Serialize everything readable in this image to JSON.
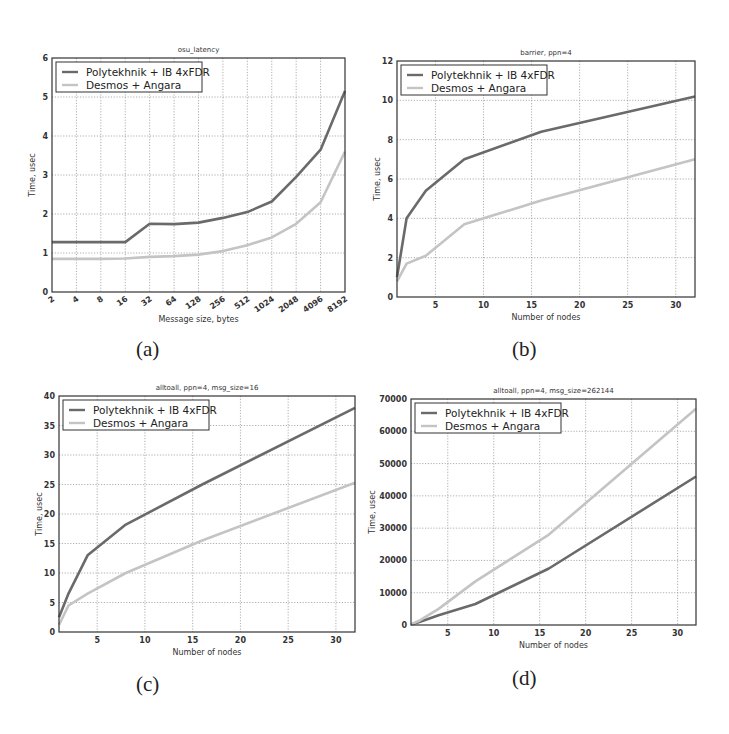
{
  "colors": {
    "polytekhnik": "#6a6a6a",
    "desmos": "#c4c4c4",
    "axis": "#333333",
    "grid": "#9a9a9a"
  },
  "sublabels": [
    "(a)",
    "(b)",
    "(c)",
    "(d)"
  ],
  "chart_data": [
    {
      "type": "line",
      "title": "osu_latency",
      "xlabel": "Message size, bytes",
      "ylabel": "Time, usec",
      "xscale": "categorical-log2",
      "categories": [
        "2",
        "4",
        "8",
        "16",
        "32",
        "64",
        "128",
        "256",
        "512",
        "1024",
        "2048",
        "4096",
        "8192"
      ],
      "ylim": [
        0,
        6
      ],
      "yticks": [
        0,
        1,
        2,
        3,
        4,
        5,
        6
      ],
      "grid": true,
      "legend_position": "upper left",
      "series": [
        {
          "name": "Polytekhnik + IB 4xFDR",
          "values": [
            1.28,
            1.28,
            1.28,
            1.28,
            1.75,
            1.74,
            1.78,
            1.9,
            2.05,
            2.32,
            2.95,
            3.65,
            5.15
          ]
        },
        {
          "name": "Desmos + Angara",
          "values": [
            0.85,
            0.85,
            0.85,
            0.86,
            0.9,
            0.92,
            0.96,
            1.05,
            1.2,
            1.4,
            1.75,
            2.3,
            3.6
          ]
        }
      ]
    },
    {
      "type": "line",
      "title": "barrier, ppn=4",
      "xlabel": "Number of nodes",
      "ylabel": "Time, usec",
      "x": [
        1,
        2,
        4,
        8,
        16,
        32
      ],
      "xlim": [
        1,
        32
      ],
      "xticks": [
        5,
        10,
        15,
        20,
        25,
        30
      ],
      "ylim": [
        0,
        12
      ],
      "yticks": [
        0,
        2,
        4,
        6,
        8,
        10,
        12
      ],
      "grid": true,
      "legend_position": "upper left",
      "series": [
        {
          "name": "Polytekhnik + IB 4xFDR",
          "values": [
            1.0,
            4.0,
            5.4,
            7.0,
            8.4,
            10.2
          ]
        },
        {
          "name": "Desmos + Angara",
          "values": [
            0.8,
            1.7,
            2.1,
            3.7,
            4.9,
            7.0
          ]
        }
      ]
    },
    {
      "type": "line",
      "title": "alltoall, ppn=4, msg_size=16",
      "xlabel": "Number of nodes",
      "ylabel": "Time, usec",
      "x": [
        1,
        2,
        4,
        8,
        16,
        32
      ],
      "xlim": [
        1,
        32
      ],
      "xticks": [
        5,
        10,
        15,
        20,
        25,
        30
      ],
      "ylim": [
        0,
        40
      ],
      "yticks": [
        0,
        5,
        10,
        15,
        20,
        25,
        30,
        35,
        40
      ],
      "grid": true,
      "legend_position": "upper left",
      "series": [
        {
          "name": "Polytekhnik + IB 4xFDR",
          "values": [
            2.5,
            6.5,
            13.0,
            18.2,
            25.0,
            38.0
          ]
        },
        {
          "name": "Desmos + Angara",
          "values": [
            1.2,
            4.5,
            6.5,
            10.0,
            15.5,
            25.3
          ]
        }
      ]
    },
    {
      "type": "line",
      "title": "alltoall, ppn=4, msg_size=262144",
      "xlabel": "Number of nodes",
      "ylabel": "Time, usec",
      "x": [
        1,
        2,
        4,
        8,
        16,
        32
      ],
      "xlim": [
        1,
        32
      ],
      "xticks": [
        5,
        10,
        15,
        20,
        25,
        30
      ],
      "ylim": [
        0,
        70000
      ],
      "yticks": [
        0,
        10000,
        20000,
        30000,
        40000,
        50000,
        60000,
        70000
      ],
      "grid": true,
      "legend_position": "upper left",
      "series": [
        {
          "name": "Polytekhnik + IB 4xFDR",
          "values": [
            200,
            1000,
            3000,
            6500,
            17500,
            46000
          ]
        },
        {
          "name": "Desmos + Angara",
          "values": [
            200,
            1500,
            5000,
            13500,
            28000,
            67000
          ]
        }
      ]
    }
  ]
}
